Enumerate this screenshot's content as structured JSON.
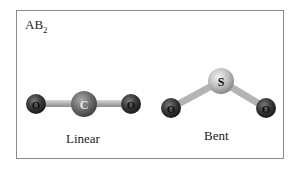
{
  "panel": {
    "title_main": "AB",
    "title_sub": "2"
  },
  "molecules": [
    {
      "name": "Linear",
      "atoms": [
        {
          "symbol": "O",
          "role": "terminal"
        },
        {
          "symbol": "C",
          "role": "central"
        },
        {
          "symbol": "O",
          "role": "terminal"
        }
      ]
    },
    {
      "name": "Bent",
      "atoms": [
        {
          "symbol": "O",
          "role": "terminal"
        },
        {
          "symbol": "S",
          "role": "central"
        },
        {
          "symbol": "O",
          "role": "terminal"
        }
      ]
    }
  ],
  "colors": {
    "oxygen": "#3a3a3a",
    "carbon": "#6e6e6e",
    "sulfur": "#bdbdbd",
    "bond": "#b8b8b8",
    "frame": "#8a8a8a"
  }
}
